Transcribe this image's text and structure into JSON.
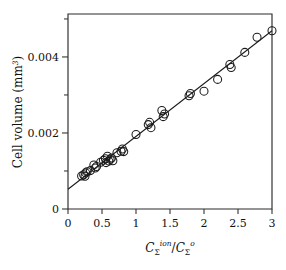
{
  "figure": {
    "background": "#ffffff",
    "ink_color": "#1a1a1a"
  },
  "chart_data": {
    "type": "scatter",
    "title": "",
    "subtitle": "",
    "xlabel": "C_Σ^{ion} / C_Σ^{o}",
    "xlabel_parts": {
      "numerator_symbol": "C",
      "numerator_subscript": "Σ",
      "numerator_superscript": "ion",
      "separator": "/",
      "denominator_symbol": "C",
      "denominator_subscript": "Σ",
      "denominator_superscript": "o"
    },
    "ylabel": "Cell volume (mm³)",
    "ylabel_parts": {
      "text": "Cell volume (mm",
      "superscript": "3",
      "close": ")"
    },
    "xlim": [
      0,
      3
    ],
    "ylim": [
      0,
      0.00513
    ],
    "xticks": [
      0,
      0.5,
      1,
      1.5,
      2,
      2.5,
      3
    ],
    "xticklabels": [
      "0",
      "0.5",
      "1",
      "1.5",
      "2",
      "2.5",
      "3"
    ],
    "yticks": [
      0,
      0.002,
      0.004
    ],
    "yticklabels": [
      "0",
      "0.002",
      "0.004"
    ],
    "y_minor_ticks": [
      0.001,
      0.003,
      0.005
    ],
    "grid": false,
    "legend": null,
    "marker_style": "open-circle",
    "marker_radius_px": 4.0,
    "fit_line": {
      "label": "linear regression",
      "slope": 0.00139,
      "intercept": 0.00052,
      "x_start": 0.0,
      "x_end": 3.0,
      "y_start": 0.00052,
      "y_end": 0.00469
    },
    "points": [
      {
        "x": 0.2,
        "y": 0.00087
      },
      {
        "x": 0.23,
        "y": 0.0009
      },
      {
        "x": 0.25,
        "y": 0.00086
      },
      {
        "x": 0.26,
        "y": 0.00095
      },
      {
        "x": 0.28,
        "y": 0.00098
      },
      {
        "x": 0.33,
        "y": 0.00101
      },
      {
        "x": 0.38,
        "y": 0.00116
      },
      {
        "x": 0.4,
        "y": 0.00108
      },
      {
        "x": 0.42,
        "y": 0.00112
      },
      {
        "x": 0.48,
        "y": 0.00123
      },
      {
        "x": 0.52,
        "y": 0.00128
      },
      {
        "x": 0.55,
        "y": 0.00132
      },
      {
        "x": 0.56,
        "y": 0.00122
      },
      {
        "x": 0.58,
        "y": 0.00139
      },
      {
        "x": 0.6,
        "y": 0.00126
      },
      {
        "x": 0.62,
        "y": 0.00131
      },
      {
        "x": 0.64,
        "y": 0.00134
      },
      {
        "x": 0.66,
        "y": 0.00127
      },
      {
        "x": 0.72,
        "y": 0.00148
      },
      {
        "x": 0.78,
        "y": 0.00152
      },
      {
        "x": 0.8,
        "y": 0.00158
      },
      {
        "x": 0.82,
        "y": 0.00151
      },
      {
        "x": 1.0,
        "y": 0.00196
      },
      {
        "x": 1.18,
        "y": 0.00222
      },
      {
        "x": 1.2,
        "y": 0.00228
      },
      {
        "x": 1.22,
        "y": 0.00214
      },
      {
        "x": 1.38,
        "y": 0.00259
      },
      {
        "x": 1.4,
        "y": 0.00243
      },
      {
        "x": 1.42,
        "y": 0.0025
      },
      {
        "x": 1.78,
        "y": 0.00298
      },
      {
        "x": 1.8,
        "y": 0.00304
      },
      {
        "x": 2.0,
        "y": 0.0031
      },
      {
        "x": 2.2,
        "y": 0.00341
      },
      {
        "x": 2.38,
        "y": 0.0038
      },
      {
        "x": 2.4,
        "y": 0.00372
      },
      {
        "x": 2.6,
        "y": 0.00412
      },
      {
        "x": 2.78,
        "y": 0.00452
      },
      {
        "x": 3.0,
        "y": 0.00469
      }
    ]
  }
}
